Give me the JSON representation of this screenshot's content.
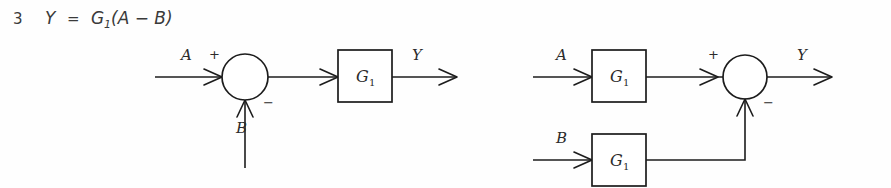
{
  "figure": {
    "equation": {
      "number": "3",
      "lhs": "Y",
      "equals": "=",
      "gain": "G",
      "gain_subscript": "1",
      "rhs": "(A  −  B)",
      "full_text": "Y = G1(A − B)"
    },
    "diagrams": [
      {
        "id": "left-diagram",
        "name": "single-block-with-summing-junction",
        "inputs": [
          {
            "label": "A",
            "sign": "+",
            "direction": "horizontal-right"
          },
          {
            "label": "B",
            "sign": "−",
            "direction": "vertical-up"
          }
        ],
        "blocks": [
          {
            "label": "G",
            "subscript": "1",
            "name": "gain-block-g1"
          }
        ],
        "summing_junction": {
          "name": "summing-junction",
          "shape": "circle"
        },
        "output": {
          "label": "Y"
        }
      },
      {
        "id": "right-diagram",
        "name": "two-blocks-with-summing-junction",
        "inputs": [
          {
            "label": "A",
            "sign": "+",
            "direction": "horizontal-right",
            "path": "upper"
          },
          {
            "label": "B",
            "sign": "−",
            "direction": "horizontal-right",
            "path": "lower"
          }
        ],
        "blocks": [
          {
            "label": "G",
            "subscript": "1",
            "name": "gain-block-g1-upper"
          },
          {
            "label": "G",
            "subscript": "1",
            "name": "gain-block-g1-lower"
          }
        ],
        "summing_junction": {
          "name": "summing-junction",
          "shape": "circle"
        },
        "output": {
          "label": "Y"
        }
      }
    ],
    "colors": {
      "background": "#fefefe",
      "ink": "#1c1c1c",
      "text": "#2b2b2b",
      "equation_text": "#3a3a3a"
    }
  }
}
